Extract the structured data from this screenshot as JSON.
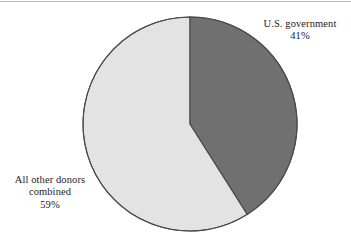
{
  "figure": {
    "name": "donor-share-pie-chart",
    "background_color": "#ffffff",
    "top_rule_color": "#b9b9b9",
    "width": 351,
    "height": 247
  },
  "chart_data": {
    "type": "pie",
    "title": "",
    "subtitle": "",
    "xlabel": "",
    "ylabel": "",
    "grid": false,
    "legend_position": "none",
    "labels_inline": true,
    "start_angle_deg": 0,
    "direction": "clockwise",
    "center": {
      "x": 190,
      "y": 124
    },
    "radius": 107,
    "outline_color": "#4a4a4a",
    "categories": [
      "U.S. government",
      "All other donors combined"
    ],
    "values": [
      41,
      59
    ],
    "value_unit": "%",
    "slices": [
      {
        "name": "U.S. government",
        "label_lines": [
          "U.S. government",
          "41%"
        ],
        "value": 41,
        "value_text": "41%",
        "color": "#707070",
        "start_deg": 0,
        "end_deg": 147.6
      },
      {
        "name": "All other donors combined",
        "label_lines": [
          "All other donors",
          "combined",
          "59%"
        ],
        "value": 59,
        "value_text": "59%",
        "color": "#e3e3e3",
        "start_deg": 147.6,
        "end_deg": 360
      }
    ]
  },
  "labels": {
    "us_government": {
      "line1": "U.S. government",
      "line2": "41%"
    },
    "other_donors": {
      "line1": "All other donors",
      "line2": "combined",
      "line3": "59%"
    }
  }
}
